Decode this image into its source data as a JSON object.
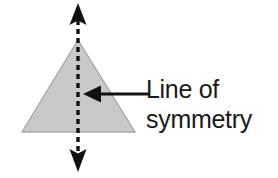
{
  "diagram": {
    "title": "Line of symmetry",
    "background_color": "#ffffff",
    "shape": {
      "name": "triangle",
      "type": "isosceles-triangle",
      "fill_color": "#c9c9c9",
      "stroke_color": "#a8a8a8",
      "apex": {
        "x": 78,
        "y": 40
      },
      "bottom_left": {
        "x": 22,
        "y": 132
      },
      "bottom_right": {
        "x": 135,
        "y": 132
      }
    },
    "symmetry_line": {
      "name": "vertical-dashed-double-arrow",
      "color": "#111111",
      "orientation": "vertical",
      "x": 78,
      "top_y": 4,
      "bottom_y": 172,
      "dash_length": 5,
      "dash_gap": 4,
      "stroke_width": 3,
      "arrowheads": "both"
    },
    "pointer": {
      "name": "leader-arrow",
      "color": "#111111",
      "orientation": "horizontal-left",
      "tip": {
        "x": 84,
        "y": 94
      },
      "tail": {
        "x": 148,
        "y": 94
      },
      "stroke_width": 3
    },
    "label": {
      "lines": [
        "Line of",
        "symmetry"
      ],
      "line1": "Line of",
      "line2": "symmetry",
      "color": "#1a1a1a",
      "font_size_px": 25
    }
  }
}
